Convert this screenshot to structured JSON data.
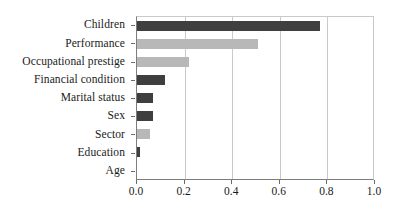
{
  "chart_data": {
    "type": "bar",
    "orientation": "horizontal",
    "title": "",
    "subtitle": "",
    "xlabel": "",
    "ylabel": "",
    "xlim": [
      0.0,
      1.0
    ],
    "grid": true,
    "legend": false,
    "categories": [
      "Children",
      "Performance",
      "Occupational prestige",
      "Financial condition",
      "Marital status",
      "Sex",
      "Sector",
      "Education",
      "Age"
    ],
    "values": [
      0.77,
      0.51,
      0.22,
      0.118,
      0.067,
      0.067,
      0.055,
      0.013,
      0.0
    ],
    "bar_colors": [
      "#3f3f3f",
      "#b8b8b8",
      "#b8b8b8",
      "#3f3f3f",
      "#3f3f3f",
      "#3f3f3f",
      "#b8b8b8",
      "#3f3f3f",
      "#3f3f3f"
    ],
    "xticks": [
      0.0,
      0.2,
      0.4,
      0.6,
      0.8,
      1.0
    ],
    "xticklabels": [
      "0.0",
      "0.2",
      "0.4",
      "0.6",
      "0.8",
      "1.0"
    ]
  },
  "colors": {
    "dark_bar": "#3f3f3f",
    "light_bar": "#b8b8b8",
    "gridline": "#c9c9c9",
    "axis": "#7d7d7d",
    "text": "#1a1a1a",
    "background": "#ffffff"
  }
}
